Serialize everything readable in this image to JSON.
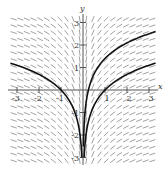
{
  "figure": {
    "type": "slope_field",
    "equation": "dy/dx = 1/x",
    "axis_labels": {
      "x": "x",
      "y": "y"
    },
    "x_ticks": [
      "-3",
      "-2",
      "-1",
      "1",
      "2",
      "3"
    ],
    "y_ticks": [
      "-3",
      "-2",
      "-1",
      "1",
      "2",
      "3"
    ],
    "colors": {
      "segments": "#8a8a8a",
      "axes": "#555555",
      "curves": "#111111"
    }
  },
  "chart_data": {
    "type": "line",
    "title": "",
    "xlabel": "x",
    "ylabel": "y",
    "xlim": [
      -3.3,
      3.3
    ],
    "ylim": [
      -3.3,
      3.3
    ],
    "grid": false,
    "slope_field": {
      "dy_dx": "1/x",
      "x_step": 0.3,
      "y_step": 0.3
    },
    "series": [
      {
        "name": "y = ln|x| (x<0)",
        "domain": [
          -3.3,
          -0.05
        ],
        "C": 0
      },
      {
        "name": "y = ln x",
        "domain": [
          0.05,
          3.3
        ],
        "C": 0
      },
      {
        "name": "y = ln x + 1.4",
        "domain": [
          0.02,
          3.3
        ],
        "C": 1.4
      }
    ]
  }
}
